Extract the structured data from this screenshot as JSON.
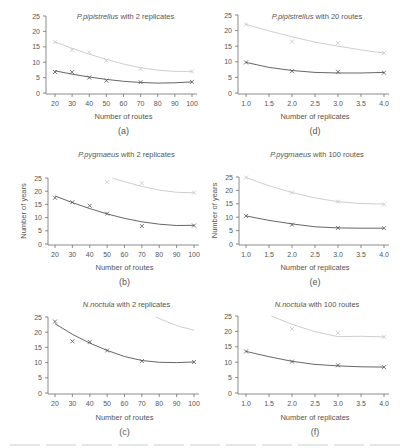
{
  "colors": {
    "axis": "#707070",
    "text": "#555555",
    "upper_series": "#c8c8c8",
    "lower_series": "#555555"
  },
  "chart_data": [
    {
      "id": "a",
      "type": "line",
      "title_italic": "P.pipistrellus",
      "title_rest": " with 2 replicates",
      "panel_label": "(a)",
      "xlabel": "Number of routes",
      "ylabel": "",
      "xticks": [
        20,
        30,
        40,
        50,
        60,
        70,
        80,
        90,
        100
      ],
      "xtick_labels": [
        "20",
        "30",
        "40",
        "50",
        "60",
        "70",
        "80",
        "90",
        "100"
      ],
      "yticks": [
        0,
        5,
        10,
        15,
        20,
        25
      ],
      "xlim": [
        20,
        100
      ],
      "ylim": [
        0,
        25
      ],
      "series": [
        {
          "name": "upper",
          "x": [
            20,
            30,
            40,
            50,
            70,
            100
          ],
          "points": [
            16.5,
            14,
            13.2,
            10.5,
            7.8,
            7.0
          ],
          "fit": [
            [
              20,
              16.6
            ],
            [
              30,
              14.5
            ],
            [
              40,
              12.6
            ],
            [
              50,
              10.9
            ],
            [
              60,
              9.4
            ],
            [
              70,
              8.2
            ],
            [
              80,
              7.4
            ],
            [
              90,
              7.0
            ],
            [
              100,
              7.0
            ]
          ]
        },
        {
          "name": "lower",
          "x": [
            20,
            30,
            40,
            50,
            70,
            100
          ],
          "points": [
            6.8,
            6.8,
            5.0,
            4.0,
            3.5,
            3.6
          ],
          "fit": [
            [
              20,
              7.2
            ],
            [
              30,
              6.1
            ],
            [
              40,
              5.2
            ],
            [
              50,
              4.4
            ],
            [
              60,
              3.8
            ],
            [
              70,
              3.4
            ],
            [
              80,
              3.2
            ],
            [
              90,
              3.3
            ],
            [
              100,
              3.6
            ]
          ]
        }
      ]
    },
    {
      "id": "d",
      "type": "line",
      "title_italic": "P.pipistrellus",
      "title_rest": " with 20 routes",
      "panel_label": "(d)",
      "xlabel": "Number of replicates",
      "ylabel": "",
      "xticks": [
        1.0,
        1.5,
        2.0,
        2.5,
        3.0,
        3.5,
        4.0
      ],
      "xtick_labels": [
        "1.0",
        "1.5",
        "2.0",
        "2.5",
        "3.0",
        "3.5",
        "4.0"
      ],
      "yticks": [
        0,
        5,
        10,
        15,
        20,
        25
      ],
      "xlim": [
        1.0,
        4.0
      ],
      "ylim": [
        0,
        25
      ],
      "series": [
        {
          "name": "upper",
          "x": [
            1,
            2,
            3,
            4
          ],
          "points": [
            22.0,
            16.5,
            16.0,
            12.8
          ],
          "fit": [
            [
              1,
              22.0
            ],
            [
              1.5,
              19.9
            ],
            [
              2,
              18.0
            ],
            [
              2.5,
              16.3
            ],
            [
              3,
              15.0
            ],
            [
              3.5,
              13.8
            ],
            [
              4,
              12.8
            ]
          ]
        },
        {
          "name": "lower",
          "x": [
            1,
            2,
            3,
            4
          ],
          "points": [
            9.8,
            7.0,
            6.8,
            6.5
          ],
          "fit": [
            [
              1,
              9.8
            ],
            [
              1.5,
              8.2
            ],
            [
              2,
              7.2
            ],
            [
              2.5,
              6.6
            ],
            [
              3,
              6.4
            ],
            [
              3.5,
              6.4
            ],
            [
              4,
              6.6
            ]
          ]
        }
      ]
    },
    {
      "id": "b",
      "type": "line",
      "title_italic": "P.pygmaeus",
      "title_rest": " with 2 replicates",
      "panel_label": "(b)",
      "xlabel": "Number of routes",
      "ylabel": "Number of years",
      "xticks": [
        20,
        30,
        40,
        50,
        60,
        70,
        80,
        90,
        100
      ],
      "xtick_labels": [
        "20",
        "30",
        "40",
        "50",
        "60",
        "70",
        "80",
        "90",
        "100"
      ],
      "yticks": [
        0,
        5,
        10,
        15,
        20,
        25
      ],
      "xlim": [
        20,
        100
      ],
      "ylim": [
        0,
        25
      ],
      "series": [
        {
          "name": "upper",
          "x": [
            50,
            70,
            100
          ],
          "points": [
            23.5,
            23.0,
            19.5
          ],
          "fit": [
            [
              53,
              25.0
            ],
            [
              60,
              23.6
            ],
            [
              70,
              21.8
            ],
            [
              80,
              20.4
            ],
            [
              90,
              19.6
            ],
            [
              100,
              19.4
            ]
          ]
        },
        {
          "name": "lower",
          "x": [
            20,
            30,
            40,
            50,
            70,
            100
          ],
          "points": [
            17.5,
            15.8,
            14.5,
            11.5,
            6.8,
            7.0
          ],
          "fit": [
            [
              20,
              18.2
            ],
            [
              30,
              15.7
            ],
            [
              40,
              13.4
            ],
            [
              50,
              11.4
            ],
            [
              60,
              9.7
            ],
            [
              70,
              8.4
            ],
            [
              80,
              7.5
            ],
            [
              90,
              7.0
            ],
            [
              100,
              7.1
            ]
          ]
        }
      ]
    },
    {
      "id": "e",
      "type": "line",
      "title_italic": "P.pygmaeus",
      "title_rest": " with 100 routes",
      "panel_label": "(e)",
      "xlabel": "Number of replicates",
      "ylabel": "Number of years",
      "xticks": [
        1.0,
        1.5,
        2.0,
        2.5,
        3.0,
        3.5,
        4.0
      ],
      "xtick_labels": [
        "1.0",
        "1.5",
        "2.0",
        "2.5",
        "3.0",
        "3.5",
        "4.0"
      ],
      "yticks": [
        0,
        5,
        10,
        15,
        20,
        25
      ],
      "xlim": [
        1.0,
        4.0
      ],
      "ylim": [
        0,
        25
      ],
      "series": [
        {
          "name": "upper",
          "x": [
            1,
            2,
            3,
            4
          ],
          "points": [
            24.8,
            19.2,
            15.8,
            14.8
          ],
          "fit": [
            [
              1,
              24.8
            ],
            [
              1.5,
              21.7
            ],
            [
              2,
              19.2
            ],
            [
              2.5,
              17.2
            ],
            [
              3,
              15.8
            ],
            [
              3.5,
              15.1
            ],
            [
              4,
              14.9
            ]
          ]
        },
        {
          "name": "lower",
          "x": [
            1,
            2,
            3,
            4
          ],
          "points": [
            10.5,
            7.2,
            6.0,
            5.9
          ],
          "fit": [
            [
              1,
              10.5
            ],
            [
              1.5,
              8.8
            ],
            [
              2,
              7.5
            ],
            [
              2.5,
              6.4
            ],
            [
              3,
              6.0
            ],
            [
              3.5,
              5.9
            ],
            [
              4,
              5.9
            ]
          ]
        }
      ]
    },
    {
      "id": "c",
      "type": "line",
      "title_italic": "N.noctula",
      "title_rest": " with 2 replicates",
      "panel_label": "(c)",
      "xlabel": "Number of routes",
      "ylabel": "",
      "xticks": [
        20,
        30,
        40,
        50,
        60,
        70,
        80,
        90,
        100
      ],
      "xtick_labels": [
        "20",
        "30",
        "40",
        "50",
        "60",
        "70",
        "80",
        "90",
        "100"
      ],
      "yticks": [
        0,
        5,
        10,
        15,
        20,
        25
      ],
      "xlim": [
        20,
        100
      ],
      "ylim": [
        0,
        25
      ],
      "series": [
        {
          "name": "upper",
          "x": [],
          "points": [],
          "fit": [
            [
              78,
              25.0
            ],
            [
              85,
              23.3
            ],
            [
              92,
              21.8
            ],
            [
              100,
              20.7
            ]
          ]
        },
        {
          "name": "lower",
          "x": [
            20,
            30,
            40,
            50,
            70,
            100
          ],
          "points": [
            23.5,
            17.0,
            16.8,
            14.0,
            10.5,
            10.2
          ],
          "fit": [
            [
              20,
              22.8
            ],
            [
              30,
              19.3
            ],
            [
              40,
              16.4
            ],
            [
              50,
              14.0
            ],
            [
              60,
              12.0
            ],
            [
              70,
              10.7
            ],
            [
              80,
              10.1
            ],
            [
              90,
              10.0
            ],
            [
              100,
              10.2
            ]
          ]
        }
      ]
    },
    {
      "id": "f",
      "type": "line",
      "title_italic": "N.noctula",
      "title_rest": " with 100 routes",
      "panel_label": "(f)",
      "xlabel": "Number of replicates",
      "ylabel": "",
      "xticks": [
        1.0,
        1.5,
        2.0,
        2.5,
        3.0,
        3.5,
        4.0
      ],
      "xtick_labels": [
        "1.0",
        "1.5",
        "2.0",
        "2.5",
        "3.0",
        "3.5",
        "4.0"
      ],
      "yticks": [
        0,
        5,
        10,
        15,
        20,
        25
      ],
      "xlim": [
        1.0,
        4.0
      ],
      "ylim": [
        0,
        25
      ],
      "series": [
        {
          "name": "upper",
          "x": [
            2,
            3,
            4
          ],
          "points": [
            20.8,
            19.5,
            18.2
          ],
          "fit": [
            [
              1.55,
              25.0
            ],
            [
              2,
              22.3
            ],
            [
              2.5,
              19.9
            ],
            [
              3,
              18.3
            ],
            [
              3.5,
              18.4
            ],
            [
              4,
              18.2
            ]
          ]
        },
        {
          "name": "lower",
          "x": [
            1,
            2,
            3,
            4
          ],
          "points": [
            13.5,
            10.2,
            9.0,
            8.4
          ],
          "fit": [
            [
              1,
              13.5
            ],
            [
              1.5,
              11.8
            ],
            [
              2,
              10.3
            ],
            [
              2.5,
              9.3
            ],
            [
              3,
              8.8
            ],
            [
              3.5,
              8.5
            ],
            [
              4,
              8.4
            ]
          ]
        }
      ]
    }
  ],
  "layout_panels": {
    "a": {
      "ox": 46,
      "x0": 55,
      "x1": 192,
      "ytop": 16,
      "ybot": 93,
      "title_y": 19,
      "tick_y": 106,
      "xlabel_y": 119,
      "label_y": 134
    },
    "d": {
      "ox": 238,
      "x0": 246,
      "x1": 384,
      "ytop": 15,
      "ybot": 93,
      "title_y": 19,
      "tick_y": 106,
      "xlabel_y": 119,
      "label_y": 134
    },
    "b": {
      "ox": 48,
      "x0": 55,
      "x1": 194,
      "ytop": 178,
      "ybot": 244,
      "title_y": 157,
      "tick_y": 257,
      "xlabel_y": 270,
      "label_y": 285
    },
    "e": {
      "ox": 239,
      "x0": 246,
      "x1": 384,
      "ytop": 177,
      "ybot": 244,
      "title_y": 157,
      "tick_y": 257,
      "xlabel_y": 270,
      "label_y": 285
    },
    "c": {
      "ox": 48,
      "x0": 55,
      "x1": 194,
      "ytop": 317,
      "ybot": 393,
      "title_y": 307,
      "tick_y": 406,
      "xlabel_y": 420,
      "label_y": 435
    },
    "f": {
      "ox": 238,
      "x0": 246,
      "x1": 384,
      "ytop": 316,
      "ybot": 393,
      "title_y": 307,
      "tick_y": 406,
      "xlabel_y": 420,
      "label_y": 435
    }
  }
}
